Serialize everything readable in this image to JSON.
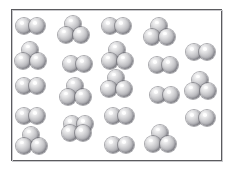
{
  "figure": {
    "title": "",
    "frame": {
      "x": 11,
      "y": 9,
      "width": 211,
      "height": 152,
      "border_color": "#5b5b5f",
      "background_color": "#ffffff"
    },
    "atom": {
      "color_highlight": "#ffffff",
      "color_mid": "#c8c8cb",
      "color_shadow": "#7e7e85",
      "outline_color": "#60606a",
      "radius": 8
    },
    "legend": {
      "diatomic_label": "diatomic molecule",
      "triatomic_label": "triatomic molecule"
    },
    "counts": {
      "diatomic": 12,
      "triatomic": 10,
      "total": 22
    },
    "molecules": [
      {
        "id": "m01",
        "type": "diatomic",
        "x": 30,
        "y": 26,
        "row": 1
      },
      {
        "id": "m02",
        "type": "triatomic",
        "x": 74,
        "y": 31,
        "row": 1
      },
      {
        "id": "m03",
        "type": "diatomic",
        "x": 116,
        "y": 26,
        "row": 1
      },
      {
        "id": "m04",
        "type": "triatomic",
        "x": 160,
        "y": 33,
        "row": 1
      },
      {
        "id": "m05",
        "type": "triatomic",
        "x": 31,
        "y": 57,
        "row": 2
      },
      {
        "id": "m06",
        "type": "diatomic",
        "x": 77,
        "y": 64,
        "row": 2
      },
      {
        "id": "m07",
        "type": "triatomic",
        "x": 118,
        "y": 57,
        "row": 2
      },
      {
        "id": "m08",
        "type": "diatomic",
        "x": 163,
        "y": 65,
        "row": 2
      },
      {
        "id": "m09",
        "type": "diatomic",
        "x": 200,
        "y": 52,
        "row": 2
      },
      {
        "id": "m10",
        "type": "diatomic",
        "x": 30,
        "y": 86,
        "row": 3
      },
      {
        "id": "m11",
        "type": "triatomic",
        "x": 76,
        "y": 93,
        "row": 3
      },
      {
        "id": "m12",
        "type": "triatomic",
        "x": 117,
        "y": 85,
        "row": 3
      },
      {
        "id": "m13",
        "type": "diatomic",
        "x": 164,
        "y": 95,
        "row": 3
      },
      {
        "id": "m14",
        "type": "triatomic",
        "x": 201,
        "y": 87,
        "row": 3
      },
      {
        "id": "m15",
        "type": "diatomic",
        "x": 30,
        "y": 116,
        "row": 4
      },
      {
        "id": "m16",
        "type": "diatomic",
        "x": 78,
        "y": 124,
        "row": 4
      },
      {
        "id": "m17",
        "type": "diatomic",
        "x": 119,
        "y": 116,
        "row": 4
      },
      {
        "id": "m18",
        "type": "diatomic",
        "x": 200,
        "y": 118,
        "row": 4
      },
      {
        "id": "m19",
        "type": "triatomic",
        "x": 32,
        "y": 142,
        "row": 5
      },
      {
        "id": "m20",
        "type": "diatomic",
        "x": 76,
        "y": 133,
        "row": 5
      },
      {
        "id": "m21",
        "type": "diatomic",
        "x": 119,
        "y": 145,
        "row": 5
      },
      {
        "id": "m22",
        "type": "triatomic",
        "x": 161,
        "y": 140,
        "row": 5
      }
    ]
  }
}
